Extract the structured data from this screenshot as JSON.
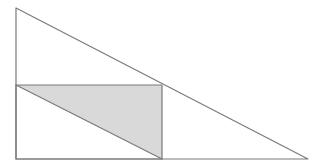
{
  "diagram": {
    "type": "geometry",
    "canvas": {
      "width": 326,
      "height": 168,
      "background": "#ffffff"
    },
    "colors": {
      "stroke": "#7a7a7a",
      "shade_fill": "#d9d9d9"
    },
    "stroke_width": 1.2,
    "points": {
      "A": {
        "x": 16,
        "y": 8
      },
      "B": {
        "x": 16,
        "y": 159
      },
      "C": {
        "x": 308,
        "y": 159
      },
      "D": {
        "x": 16,
        "y": 85
      },
      "E": {
        "x": 162,
        "y": 85
      },
      "F": {
        "x": 162,
        "y": 159
      }
    },
    "shapes": [
      {
        "id": "outer-triangle",
        "kind": "polygon",
        "vertices": [
          "A",
          "B",
          "C"
        ],
        "filled": false
      },
      {
        "id": "inscribed-rectangle",
        "kind": "polygon",
        "vertices": [
          "D",
          "E",
          "F",
          "B"
        ],
        "filled": false
      },
      {
        "id": "shaded-triangle",
        "kind": "polygon",
        "vertices": [
          "D",
          "E",
          "F"
        ],
        "filled": true
      },
      {
        "id": "rectangle-diagonal",
        "kind": "segment",
        "vertices": [
          "D",
          "F"
        ],
        "filled": false
      }
    ],
    "labels": []
  }
}
